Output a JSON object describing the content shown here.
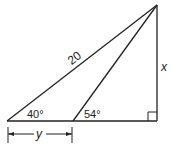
{
  "diagram": {
    "type": "geometry-triangle",
    "labels": {
      "hypotenuse": "20",
      "height": "x",
      "base_segment": "y",
      "left_angle": "40°",
      "inner_angle": "54°"
    },
    "right_angle_marker": true,
    "colors": {
      "stroke": "#222222",
      "background": "#ffffff"
    }
  }
}
